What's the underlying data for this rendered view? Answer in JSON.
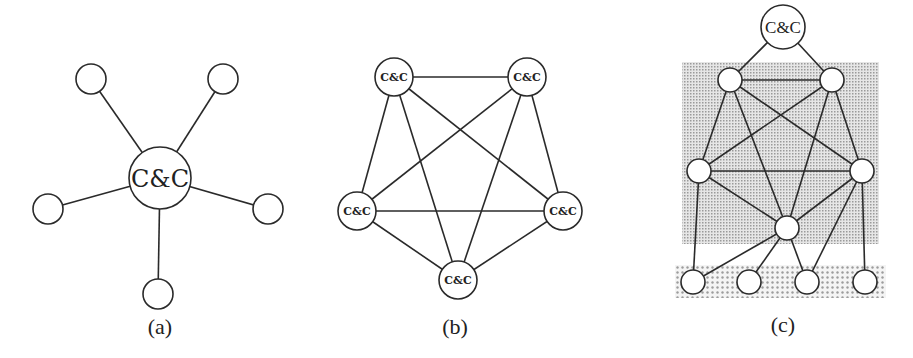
{
  "figure": {
    "panels": [
      {
        "id": "a",
        "caption": "(a)",
        "topology": "star / centralized",
        "hub_label": "C&C",
        "leaf_count": 5
      },
      {
        "id": "b",
        "caption": "(b)",
        "topology": "fully connected mesh / peer-to-peer",
        "node_labels": [
          "C&C",
          "C&C",
          "C&C",
          "C&C",
          "C&C"
        ]
      },
      {
        "id": "c",
        "caption": "(c)",
        "topology": "hierarchical / hybrid",
        "root_label": "C&C",
        "layers": [
          "upper shaded mesh layer",
          "bottom dotted leaf layer"
        ]
      }
    ]
  },
  "colors": {
    "line": "#2a2a2a",
    "node_fill": "#ffffff",
    "mesh_shading": "#bdbdbd",
    "leaf_shading": "#c4c4c4"
  }
}
